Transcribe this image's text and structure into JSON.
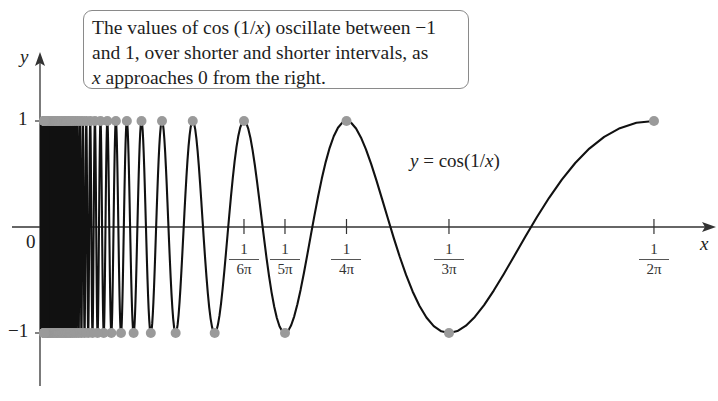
{
  "callout": {
    "line1_pre": "The values of cos (1/",
    "line1_var": "x",
    "line1_post": ") oscillate between −1",
    "line2": "and 1, over shorter and shorter intervals, as",
    "line3_var": "x",
    "line3_post": " approaches 0 from the right."
  },
  "curve_label": "y = cos(1/x)",
  "axes": {
    "x_label": "x",
    "y_label": "y",
    "origin_label": "0",
    "y_tick_1": "1",
    "y_tick_neg1": "−1"
  },
  "x_ticks": [
    {
      "num": "1",
      "den": "6π",
      "value": 0.05305
    },
    {
      "num": "1",
      "den": "5π",
      "value": 0.06366
    },
    {
      "num": "1",
      "den": "4π",
      "value": 0.07958
    },
    {
      "num": "1",
      "den": "3π",
      "value": 0.1061
    },
    {
      "num": "1",
      "den": "2π",
      "value": 0.15915
    }
  ],
  "colors": {
    "curve": "#111111",
    "dots": "#9a9a9a",
    "axes": "#333333"
  },
  "chart_data": {
    "type": "line",
    "title": "The values of cos (1/x) oscillate between −1 and 1, over shorter and shorter intervals, as x approaches 0 from the right.",
    "function": "y = cos(1/x)",
    "xlabel": "x",
    "ylabel": "y",
    "xlim": [
      0,
      0.15915
    ],
    "ylim": [
      -1,
      1
    ],
    "x_tick_labels": [
      "1/(6π)",
      "1/(5π)",
      "1/(4π)",
      "1/(3π)",
      "1/(2π)"
    ],
    "x_tick_values": [
      0.05305,
      0.06366,
      0.07958,
      0.1061,
      0.15915
    ],
    "y_tick_labels": [
      "−1",
      "0",
      "1"
    ],
    "y_tick_values": [
      -1,
      0,
      1
    ],
    "annotation": "y = cos(1/x)",
    "maxima_points": {
      "description": "x = 1/(2nπ), y = 1",
      "x": [
        0.15915,
        0.07958,
        0.05305,
        0.03979,
        0.03183,
        0.02653,
        0.02274,
        0.01989
      ],
      "y": 1
    },
    "minima_points": {
      "description": "x = 1/((2n+1)π), y = −1",
      "x": [
        0.1061,
        0.06366,
        0.04547,
        0.03537,
        0.02894,
        0.02449,
        0.02122
      ],
      "y": -1
    },
    "grid": false,
    "legend": null
  }
}
